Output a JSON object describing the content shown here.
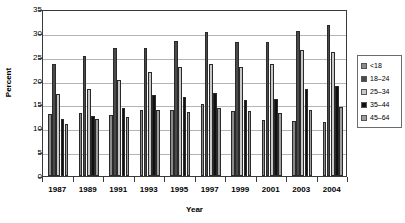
{
  "chart_data": {
    "type": "bar",
    "title": "",
    "xlabel": "Year",
    "ylabel": "Percent",
    "ylim": [
      0,
      35
    ],
    "ytick_step": 5,
    "yticks": [
      0,
      5,
      10,
      15,
      20,
      25,
      30,
      35
    ],
    "ytick_labels": [
      "0",
      "5",
      "10",
      "15",
      "20",
      "25",
      "30",
      "35"
    ],
    "grid": true,
    "legend_position": "right",
    "categories": [
      "1987",
      "1989",
      "1991",
      "1993",
      "1995",
      "1997",
      "1999",
      "2001",
      "2003",
      "2004"
    ],
    "series": [
      {
        "name": "<18",
        "color": "#8a8a8a",
        "values": [
          12.9,
          13.3,
          12.7,
          13.8,
          13.9,
          15.1,
          13.6,
          11.7,
          11.6,
          11.3
        ]
      },
      {
        "name": "18–24",
        "color": "#4a4a4a",
        "values": [
          23.4,
          25.1,
          26.8,
          26.8,
          28.2,
          30.1,
          28.1,
          28.1,
          30.3,
          31.6
        ]
      },
      {
        "name": "25–34",
        "color": "#c9c9c9",
        "values": [
          17.1,
          18.3,
          20.1,
          21.7,
          22.9,
          23.4,
          22.9,
          23.5,
          26.5,
          26.0
        ]
      },
      {
        "name": "35–44",
        "color": "#101010",
        "values": [
          11.9,
          12.5,
          14.3,
          16.9,
          16.6,
          17.4,
          15.9,
          16.2,
          18.2,
          18.8
        ]
      },
      {
        "name": "45–64",
        "color": "#9e9e9e",
        "values": [
          10.8,
          11.9,
          12.3,
          13.8,
          13.5,
          14.3,
          13.6,
          13.3,
          13.8,
          14.4
        ]
      }
    ]
  },
  "axes": {
    "y_title": "Percent",
    "x_title": "Year"
  },
  "legend": {
    "items": [
      {
        "label": "<18",
        "color": "#8a8a8a"
      },
      {
        "label": "18–24",
        "color": "#4a4a4a"
      },
      {
        "label": "25–34",
        "color": "#c9c9c9"
      },
      {
        "label": "35–44",
        "color": "#101010"
      },
      {
        "label": "45–64",
        "color": "#9e9e9e"
      }
    ]
  },
  "style": {
    "plot_border_color": "#3a3a3a",
    "gridline_color": "#b5b5b5",
    "background": "#ffffff"
  }
}
